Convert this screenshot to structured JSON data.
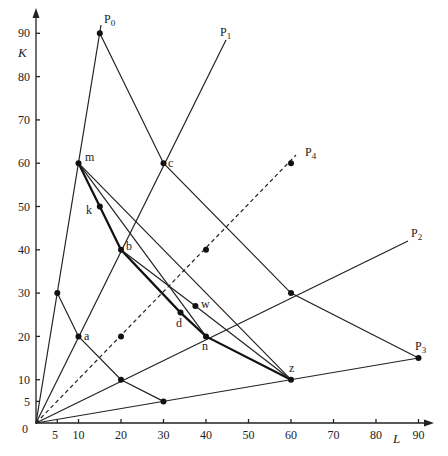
{
  "diagram": {
    "axes": {
      "x_title": "L",
      "y_title": "K",
      "x_ticks": [
        "5",
        "10",
        "20",
        "30",
        "40",
        "50",
        "60",
        "70",
        "80",
        "90"
      ],
      "y_ticks": [
        "5",
        "10",
        "20",
        "30",
        "40",
        "50",
        "60",
        "70",
        "80",
        "90"
      ],
      "origin_label": "0"
    },
    "rays": [
      {
        "label": "P",
        "sub": "0",
        "end": [
          15,
          90
        ]
      },
      {
        "label": "P",
        "sub": "1",
        "end": [
          45,
          88
        ]
      },
      {
        "label": "P",
        "sub": "2",
        "end": [
          90,
          42
        ]
      },
      {
        "label": "P",
        "sub": "3",
        "end": [
          90,
          15
        ]
      },
      {
        "label": "P",
        "sub": "4",
        "end": [
          60,
          60
        ],
        "style": "dashed"
      }
    ],
    "points": [
      {
        "name": "P0",
        "coords": [
          15,
          90
        ]
      },
      {
        "name": "m",
        "coords": [
          10,
          60
        ],
        "label": "m"
      },
      {
        "name": "c",
        "coords": [
          30,
          60
        ],
        "label": "c"
      },
      {
        "name": "k",
        "coords": [
          15,
          50
        ],
        "label": "k"
      },
      {
        "name": "b",
        "coords": [
          20,
          40
        ],
        "label": "b"
      },
      {
        "name": "p4-60",
        "coords": [
          60,
          60
        ]
      },
      {
        "name": "p4-40",
        "coords": [
          40,
          40
        ]
      },
      {
        "name": "p4-20",
        "coords": [
          20,
          20
        ]
      },
      {
        "name": "w",
        "coords": [
          37.5,
          27
        ],
        "label": "w"
      },
      {
        "name": "d",
        "coords": [
          34,
          25.5
        ],
        "label": "d"
      },
      {
        "name": "n",
        "coords": [
          40,
          20
        ],
        "label": "n"
      },
      {
        "name": "a",
        "coords": [
          10,
          20
        ],
        "label": "a"
      },
      {
        "name": "p0-30",
        "coords": [
          5,
          30
        ]
      },
      {
        "name": "p2-30",
        "coords": [
          60,
          30
        ]
      },
      {
        "name": "p2-10",
        "coords": [
          20,
          10
        ]
      },
      {
        "name": "p3-5",
        "coords": [
          30,
          5
        ]
      },
      {
        "name": "z",
        "coords": [
          60,
          10
        ],
        "label": "z"
      },
      {
        "name": "P3",
        "coords": [
          90,
          15
        ]
      }
    ]
  }
}
